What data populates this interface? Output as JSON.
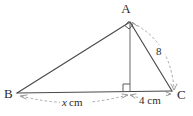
{
  "figure": {
    "type": "geometry-diagram",
    "background_color": "#ffffff",
    "line_color": "#4a4a4a",
    "dimension_color": "#9a9a9a",
    "text_color": "#2b2b2b",
    "vertices": [
      {
        "id": "A",
        "label": "A",
        "x": 130,
        "y": 22,
        "label_x": 130,
        "label_y": 12
      },
      {
        "id": "B",
        "label": "B",
        "x": 17,
        "y": 93,
        "label_x": 8,
        "label_y": 97
      },
      {
        "id": "C",
        "label": "C",
        "x": 172,
        "y": 91,
        "label_x": 180,
        "label_y": 97
      },
      {
        "id": "D",
        "label": "",
        "x": 130,
        "y": 91,
        "label_x": 130,
        "label_y": 91
      }
    ],
    "edges": [
      {
        "name": "edge-AB",
        "from": "A",
        "to": "B",
        "style": "solid"
      },
      {
        "name": "edge-BC",
        "from": "B",
        "to": "C",
        "style": "solid"
      },
      {
        "name": "edge-AC",
        "from": "A",
        "to": "C",
        "style": "solid"
      },
      {
        "name": "altitude-AD",
        "from": "A",
        "to": "D",
        "style": "solid"
      }
    ],
    "right_angles": [
      {
        "name": "right-angle-at-A",
        "at": "A",
        "between": [
          "B",
          "C"
        ]
      },
      {
        "name": "right-angle-at-D",
        "at": "D",
        "between": [
          "B",
          "A"
        ]
      }
    ],
    "dimensions": [
      {
        "name": "dimension-x-cm",
        "value": "x",
        "unit": "cm",
        "text": "x cm",
        "italic_part": "x",
        "plain_part": " cm",
        "from": "B",
        "to": "D",
        "label_x": 73,
        "label_y": 106
      },
      {
        "name": "dimension-4-cm",
        "value": "4",
        "unit": "cm",
        "text": "4 cm",
        "italic_part": "",
        "plain_part": "4 cm",
        "from": "D",
        "to": "C",
        "label_x": 151,
        "label_y": 104
      },
      {
        "name": "dimension-8",
        "value": "8",
        "unit": "",
        "text": "8",
        "italic_part": "",
        "plain_part": "8",
        "from": "A",
        "to": "C",
        "label_x": 159,
        "label_y": 53
      }
    ]
  }
}
